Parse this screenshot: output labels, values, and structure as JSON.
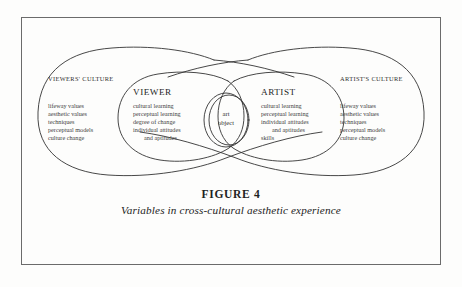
{
  "figure": {
    "number_label": "FIGURE 4",
    "caption": "Variables in cross-cultural aesthetic experience"
  },
  "diagram": {
    "line_color": "#333333",
    "frame_color": "#6b6b6b",
    "background": "#fdfdfc",
    "center": {
      "label_line_1": "art",
      "label_line_2": "object"
    },
    "regions": [
      {
        "id": "viewers-culture",
        "title": "VIEWERS' CULTURE",
        "items": [
          "lifeway values",
          "aesthetic values",
          "techniques",
          "perceptual models",
          "culture change"
        ]
      },
      {
        "id": "viewer",
        "title": "VIEWER",
        "items": [
          "cultural learning",
          "perceptual learning",
          "degree of change",
          "individual attitudes",
          "and aptitudes"
        ]
      },
      {
        "id": "artist",
        "title": "ARTIST",
        "items": [
          "cultural learning",
          "perceptual learning",
          "individual attitudes",
          "and aptitudes",
          "skills"
        ]
      },
      {
        "id": "artists-culture",
        "title": "ARTIST'S CULTURE",
        "items": [
          "lifeway values",
          "aesthetic values",
          "techniques",
          "perceptual models",
          "culture change"
        ]
      }
    ]
  }
}
